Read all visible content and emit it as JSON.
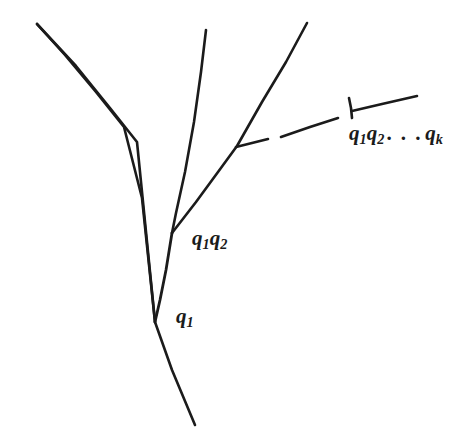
{
  "figure": {
    "background_color": "#ffffff",
    "ink_color": "#1b1b1b",
    "width": 472,
    "height": 447,
    "labels": [
      {
        "id": "q1",
        "text": "q1",
        "base": "q",
        "sub": "1",
        "x": 176,
        "y": 306,
        "describes": "first branch node"
      },
      {
        "id": "q1q2",
        "text": "q1q2",
        "x": 192,
        "y": 228,
        "describes": "second branch node"
      },
      {
        "id": "q1q2qk",
        "text": "q1q2 . . . qk",
        "x": 349,
        "y": 123,
        "describes": "k-th branch node with tick marker"
      }
    ],
    "strokes": [
      {
        "name": "left-descending-branch",
        "type": "polyline",
        "points": "37,24 80,72 124,126 155,322 195,425"
      },
      {
        "name": "middle-rising-branch",
        "type": "polyline",
        "points": "206,30 196,110 172,233"
      },
      {
        "name": "trunk-lower",
        "type": "polyline",
        "points": "155,322 172,233"
      },
      {
        "name": "right-rising-branch",
        "type": "polyline",
        "points": "172,233 237,146 307,23"
      },
      {
        "name": "short-right-stub",
        "type": "polyline",
        "points": "237,146 268,140"
      },
      {
        "name": "dash-middle",
        "type": "polyline",
        "points": "281,137 338,118"
      },
      {
        "name": "terminal-branch",
        "type": "polyline",
        "points": "352,110 417,96"
      },
      {
        "name": "tick-marker",
        "type": "polyline",
        "points": "349,98 352,117"
      }
    ]
  }
}
